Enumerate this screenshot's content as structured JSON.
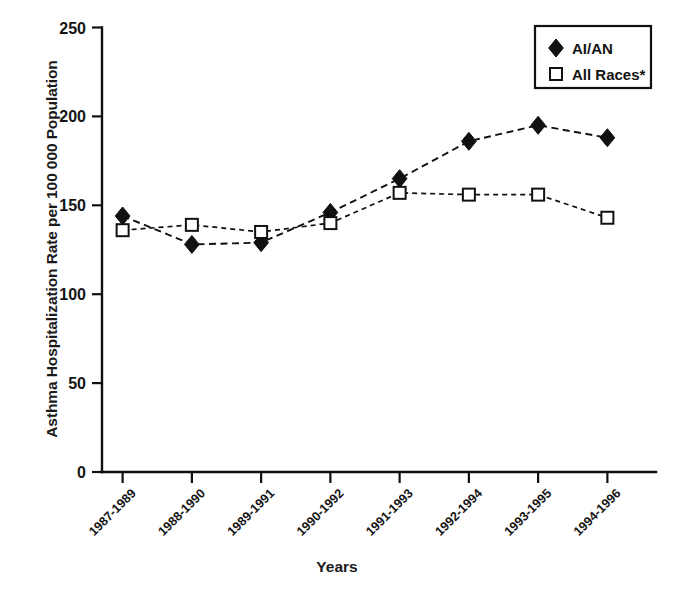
{
  "chart_data": {
    "type": "line",
    "title": "",
    "xlabel": "Years",
    "ylabel": "Asthma Hospitalization Rate per 100 000 Population",
    "categories": [
      "1987-1989",
      "1988-1990",
      "1989-1991",
      "1990-1992",
      "1991-1993",
      "1992-1994",
      "1993-1995",
      "1994-1996"
    ],
    "ylim": [
      0,
      250
    ],
    "ytick_labels": [
      "0",
      "50",
      "100",
      "150",
      "200",
      "250"
    ],
    "yticks": [
      0,
      50,
      100,
      150,
      200,
      250
    ],
    "grid": false,
    "legend_position": "top-right",
    "series": [
      {
        "name": "AI/AN",
        "marker": "filled-diamond",
        "line_style": "dashed",
        "color": "#111111",
        "values": [
          144,
          128,
          129,
          146,
          165,
          186,
          195,
          188
        ]
      },
      {
        "name": "All Races*",
        "marker": "open-square",
        "line_style": "dotted",
        "color": "#111111",
        "values": [
          136,
          139,
          135,
          140,
          157,
          156,
          156,
          143
        ]
      }
    ]
  },
  "legend": {
    "entries": [
      {
        "label": "AI/AN",
        "marker": "filled-diamond"
      },
      {
        "label": "All Races*",
        "marker": "open-square"
      }
    ]
  },
  "axes": {
    "y_title": "Asthma Hospitalization Rate per 100 000 Population",
    "x_title": "Years"
  }
}
